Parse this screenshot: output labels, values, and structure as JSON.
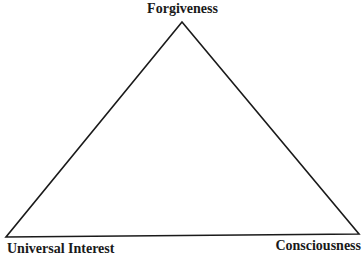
{
  "diagram": {
    "type": "triangle",
    "vertices": {
      "top": {
        "label": "Forgiveness",
        "x": 182,
        "y": 22
      },
      "bottom_left": {
        "label": "Universal Interest",
        "x": 6,
        "y": 237
      },
      "bottom_right": {
        "label": "Consciousness",
        "x": 359,
        "y": 234
      }
    },
    "stroke_color": "#1a1a1a",
    "background": "#ffffff"
  }
}
